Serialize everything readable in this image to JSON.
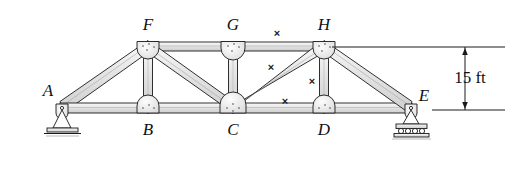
{
  "figure": {
    "line_color": "#1a1a1a",
    "member_fill": "#e8e8e8",
    "gusset_fill": "#f2f2f2",
    "background": "#ffffff"
  },
  "joints": [
    {
      "id": "A",
      "label": "A",
      "x": 62,
      "y": 108,
      "label_x": 48,
      "label_y": 96,
      "support": "pin"
    },
    {
      "id": "B",
      "label": "B",
      "x": 148,
      "y": 108,
      "label_x": 143,
      "label_y": 133,
      "support": "none"
    },
    {
      "id": "C",
      "label": "C",
      "x": 233,
      "y": 108,
      "label_x": 228,
      "label_y": 133,
      "support": "none"
    },
    {
      "id": "D",
      "label": "D",
      "x": 324,
      "y": 108,
      "label_x": 319,
      "label_y": 133,
      "support": "none"
    },
    {
      "id": "E",
      "label": "E",
      "x": 411,
      "y": 108,
      "label_x": 420,
      "label_y": 100,
      "support": "roller"
    },
    {
      "id": "F",
      "label": "F",
      "x": 148,
      "y": 47,
      "label_x": 143,
      "label_y": 28,
      "support": "none"
    },
    {
      "id": "G",
      "label": "G",
      "x": 233,
      "y": 47,
      "label_x": 228,
      "label_y": 28,
      "support": "none"
    },
    {
      "id": "H",
      "label": "H",
      "x": 324,
      "y": 47,
      "label_x": 319,
      "label_y": 28,
      "support": "none"
    }
  ],
  "members": [
    {
      "name": "A-F",
      "from": "A",
      "to": "F",
      "kind": "end-post"
    },
    {
      "name": "A-B",
      "from": "A",
      "to": "B",
      "kind": "bottom-chord"
    },
    {
      "name": "B-C",
      "from": "B",
      "to": "C",
      "kind": "bottom-chord"
    },
    {
      "name": "C-D",
      "from": "C",
      "to": "D",
      "kind": "bottom-chord"
    },
    {
      "name": "D-E",
      "from": "D",
      "to": "E",
      "kind": "bottom-chord"
    },
    {
      "name": "F-G",
      "from": "F",
      "to": "G",
      "kind": "top-chord"
    },
    {
      "name": "G-H",
      "from": "G",
      "to": "H",
      "kind": "top-chord"
    },
    {
      "name": "H-E",
      "from": "H",
      "to": "E",
      "kind": "end-post"
    },
    {
      "name": "F-B",
      "from": "F",
      "to": "B",
      "kind": "vertical"
    },
    {
      "name": "G-C",
      "from": "G",
      "to": "C",
      "kind": "vertical"
    },
    {
      "name": "H-D",
      "from": "H",
      "to": "D",
      "kind": "vertical"
    },
    {
      "name": "F-C",
      "from": "F",
      "to": "C",
      "kind": "diagonal"
    },
    {
      "name": "C-H",
      "from": "C",
      "to": "H",
      "kind": "diagonal"
    }
  ],
  "section_marks": [
    {
      "id": "x1",
      "glyph": "×",
      "x": 277,
      "y": 33
    },
    {
      "id": "x2",
      "glyph": "×",
      "x": 271,
      "y": 67
    },
    {
      "id": "x3",
      "glyph": "×",
      "x": 312,
      "y": 81
    },
    {
      "id": "x4",
      "glyph": "×",
      "x": 285,
      "y": 101
    }
  ],
  "dimension": {
    "label": "15 ft",
    "label_x": 470,
    "label_y": 77,
    "arrow_x": 465,
    "top_y": 47,
    "bottom_y": 110,
    "upper_extension": {
      "x1": 332,
      "x2": 505,
      "y": 47
    },
    "lower_extension": {
      "x1": 432,
      "x2": 505,
      "y": 110
    }
  }
}
